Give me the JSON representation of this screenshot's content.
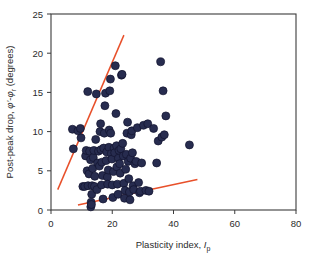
{
  "figure": {
    "background_color": "#ffffff",
    "plot_area": {
      "left": 51,
      "top": 14,
      "right": 296,
      "bottom": 210
    }
  },
  "chart_data": {
    "type": "scatter",
    "title": "",
    "xlabel": "Plasticity index, I_p",
    "xlabel_main": "Plasticity index,",
    "xlabel_italic": "I",
    "xlabel_sub": "p",
    "ylabel": "Post-peak drop, φ'-φr (degrees)",
    "ylabel_part1": "Post-peak drop,",
    "ylabel_phi1": "φ'",
    "ylabel_dash": "-",
    "ylabel_phi2": "φ",
    "ylabel_sub": "r",
    "ylabel_part2": "(degrees)",
    "xlim": [
      0,
      80
    ],
    "ylim": [
      0,
      25
    ],
    "xticks": [
      0,
      20,
      40,
      60,
      80
    ],
    "yticks": [
      0,
      5,
      10,
      15,
      20,
      25
    ],
    "grid": false,
    "legend": "none",
    "marker_color": "#272c4f",
    "marker_edge_color": "#11132e",
    "marker_size_px": 6.2,
    "trendline_color": "#e8502a",
    "series": [
      {
        "name": "Post-peak drop data",
        "points": [
          [
            7.0,
            10.3
          ],
          [
            7.3,
            7.8
          ],
          [
            8.8,
            10.1
          ],
          [
            9.6,
            10.4
          ],
          [
            9.8,
            9.2
          ],
          [
            10.4,
            3.0
          ],
          [
            11.0,
            3.0
          ],
          [
            11.3,
            6.9
          ],
          [
            11.5,
            7.6
          ],
          [
            11.8,
            5.0
          ],
          [
            12.0,
            15.1
          ],
          [
            12.1,
            3.1
          ],
          [
            12.4,
            4.6
          ],
          [
            12.6,
            7.5
          ],
          [
            12.9,
            6.4
          ],
          [
            13.0,
            0.4
          ],
          [
            13.1,
            1.0
          ],
          [
            13.2,
            0.7
          ],
          [
            13.3,
            2.0
          ],
          [
            13.4,
            3.1
          ],
          [
            13.6,
            5.3
          ],
          [
            13.8,
            6.7
          ],
          [
            14.0,
            7.6
          ],
          [
            14.2,
            3.0
          ],
          [
            14.3,
            4.3
          ],
          [
            14.6,
            9.0
          ],
          [
            14.8,
            14.8
          ],
          [
            15.0,
            2.6
          ],
          [
            15.2,
            6.0
          ],
          [
            15.5,
            7.5
          ],
          [
            15.8,
            5.6
          ],
          [
            16.0,
            10.0
          ],
          [
            16.2,
            11.0
          ],
          [
            16.3,
            7.7
          ],
          [
            16.5,
            3.2
          ],
          [
            16.6,
            6.1
          ],
          [
            16.8,
            4.4
          ],
          [
            17.0,
            1.4
          ],
          [
            17.2,
            7.9
          ],
          [
            17.4,
            9.8
          ],
          [
            17.6,
            13.3
          ],
          [
            17.8,
            14.9
          ],
          [
            18.0,
            6.3
          ],
          [
            18.2,
            7.4
          ],
          [
            18.4,
            4.2
          ],
          [
            18.5,
            3.3
          ],
          [
            18.7,
            5.1
          ],
          [
            18.9,
            8.0
          ],
          [
            19.0,
            10.2
          ],
          [
            19.2,
            15.2
          ],
          [
            19.4,
            16.7
          ],
          [
            19.5,
            9.8
          ],
          [
            19.7,
            7.2
          ],
          [
            19.9,
            6.5
          ],
          [
            20.0,
            3.2
          ],
          [
            20.2,
            1.6
          ],
          [
            20.4,
            4.9
          ],
          [
            20.6,
            7.9
          ],
          [
            20.8,
            7.3
          ],
          [
            21.0,
            18.4
          ],
          [
            21.2,
            12.3
          ],
          [
            21.4,
            8.2
          ],
          [
            21.5,
            5.5
          ],
          [
            21.7,
            3.3
          ],
          [
            21.9,
            2.0
          ],
          [
            22.0,
            6.6
          ],
          [
            22.2,
            7.6
          ],
          [
            22.4,
            5.9
          ],
          [
            22.6,
            4.7
          ],
          [
            22.8,
            7.8
          ],
          [
            23.0,
            17.2
          ],
          [
            23.2,
            17.3
          ],
          [
            23.4,
            8.5
          ],
          [
            23.6,
            6.9
          ],
          [
            23.8,
            3.4
          ],
          [
            24.0,
            1.5
          ],
          [
            24.2,
            2.5
          ],
          [
            24.4,
            5.2
          ],
          [
            24.6,
            7.1
          ],
          [
            24.8,
            9.8
          ],
          [
            25.0,
            11.2
          ],
          [
            25.2,
            6.2
          ],
          [
            25.4,
            4.0
          ],
          [
            25.6,
            2.3
          ],
          [
            25.8,
            1.3
          ],
          [
            26.0,
            6.6
          ],
          [
            26.2,
            9.6
          ],
          [
            26.4,
            10.1
          ],
          [
            26.6,
            7.3
          ],
          [
            26.8,
            3.1
          ],
          [
            27.0,
            2.6
          ],
          [
            27.4,
            5.9
          ],
          [
            27.8,
            6.2
          ],
          [
            28.2,
            10.5
          ],
          [
            28.6,
            3.5
          ],
          [
            28.9,
            2.2
          ],
          [
            29.2,
            2.4
          ],
          [
            29.6,
            6.0
          ],
          [
            30.2,
            10.8
          ],
          [
            31.0,
            2.5
          ],
          [
            31.6,
            11.0
          ],
          [
            32.0,
            2.4
          ],
          [
            33.5,
            10.4
          ],
          [
            34.5,
            6.0
          ],
          [
            35.0,
            8.8
          ],
          [
            35.8,
            18.9
          ],
          [
            36.2,
            9.3
          ],
          [
            36.6,
            15.2
          ],
          [
            37.0,
            9.6
          ],
          [
            37.5,
            12.0
          ],
          [
            45.2,
            8.3
          ]
        ]
      }
    ],
    "trendlines": [
      {
        "name": "upper-bound-line",
        "x0": 2.2,
        "y0": 2.6,
        "x1": 23.8,
        "y1": 22.3,
        "color": "#e8502a"
      },
      {
        "name": "lower-bound-line",
        "x0": 8.8,
        "y0": 0.65,
        "x1": 47.8,
        "y1": 3.9,
        "color": "#e8502a"
      }
    ]
  }
}
